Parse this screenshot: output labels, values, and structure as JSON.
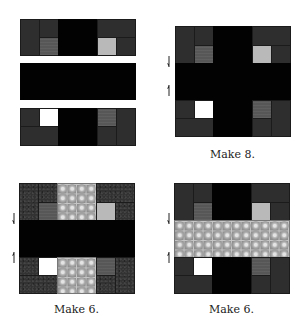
{
  "figure": {
    "colors": {
      "dark": "#2e2e2e",
      "black": "#020202",
      "medium_gray": "#575757",
      "light_gray": "#b9b9b9",
      "white": "#ffffff",
      "check_print": "#8e8e8e"
    },
    "panels": [
      {
        "id": "assembly-rows",
        "caption": "",
        "pressing_arrows": false
      },
      {
        "id": "block-a",
        "caption": "Make 8.",
        "pressing_arrows": true,
        "center_band": "black",
        "center_column": "black",
        "corner_fabric": "dark"
      },
      {
        "id": "block-b",
        "caption": "Make 6.",
        "pressing_arrows": true,
        "center_band": "black",
        "center_column": "check_print",
        "corner_fabric": "dark_speckled"
      },
      {
        "id": "block-c",
        "caption": "Make 6.",
        "pressing_arrows": true,
        "center_band": "check_print",
        "center_column": "black",
        "corner_fabric": "dark"
      }
    ],
    "arrow_directions": [
      "down",
      "up"
    ]
  }
}
